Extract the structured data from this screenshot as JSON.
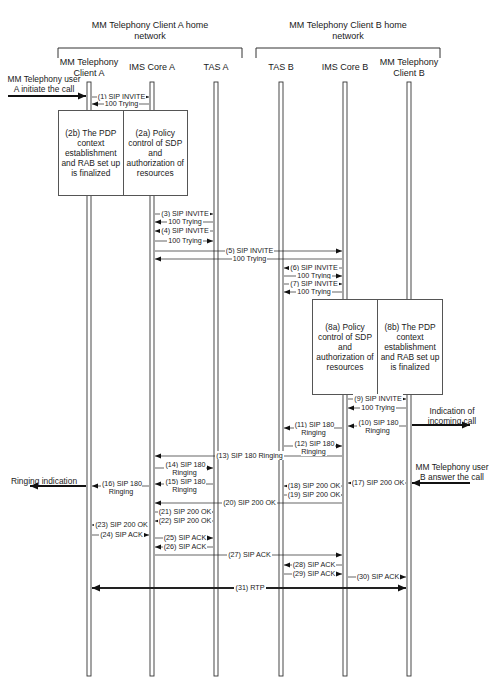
{
  "networks": [
    {
      "label_line1": "MM Telephony Client A home",
      "label_line2": "network",
      "bracket": [
        58,
        242
      ]
    },
    {
      "label_line1": "MM Telephony Client B home",
      "label_line2": "network",
      "bracket": [
        256,
        440
      ]
    }
  ],
  "lifelines": [
    {
      "id": "clientA",
      "line1": "MM Telephony",
      "line2": "Client  A",
      "x": 89
    },
    {
      "id": "imsA",
      "line1": "IMS Core A",
      "line2": "",
      "x": 152
    },
    {
      "id": "tasA",
      "line1": "TAS A",
      "line2": "",
      "x": 216
    },
    {
      "id": "tasB",
      "line1": "TAS B",
      "line2": "",
      "x": 281
    },
    {
      "id": "imsB",
      "line1": "IMS Core B",
      "line2": "",
      "x": 345
    },
    {
      "id": "clientB",
      "line1": "MM Telephony",
      "line2": "Client B",
      "x": 409
    }
  ],
  "lifeline_y": [
    82,
    676
  ],
  "boxes": [
    {
      "id": "box-2",
      "x": 58,
      "y": 110,
      "w": 128,
      "h": 84,
      "cells": [
        "(2b) The PDP context establishment and RAB set up is finalized",
        "(2a) Policy control of SDP and authorization of resources"
      ]
    },
    {
      "id": "box-8",
      "x": 312,
      "y": 299,
      "w": 129,
      "h": 94,
      "cells": [
        "(8a) Policy control of SDP and authorization of resources",
        "(8b) The PDP context establishment and RAB set up is finalized"
      ]
    }
  ],
  "messages": [
    {
      "n": 1,
      "from": "clientA",
      "to": "imsA",
      "y": 97,
      "text": "(1) SIP INVITE"
    },
    {
      "n": "1r",
      "from": "imsA",
      "to": "clientA",
      "y": 104,
      "text": "100 Trying"
    },
    {
      "n": 3,
      "from": "imsA",
      "to": "tasA",
      "y": 214,
      "text": "(3) SIP INVITE"
    },
    {
      "n": "3r",
      "from": "tasA",
      "to": "imsA",
      "y": 222,
      "text": "100 Trying"
    },
    {
      "n": 4,
      "from": "tasA",
      "to": "imsA",
      "y": 231,
      "text": "(4) SIP INVITE"
    },
    {
      "n": "4r",
      "from": "imsA",
      "to": "tasA",
      "y": 241,
      "text": "100 Trying"
    },
    {
      "n": 5,
      "from": "imsA",
      "to": "imsB",
      "y": 251,
      "text": "(5) SIP INVITE"
    },
    {
      "n": "5r",
      "from": "imsB",
      "to": "imsA",
      "y": 259,
      "text": "100 Trying"
    },
    {
      "n": 6,
      "from": "imsB",
      "to": "tasB",
      "y": 268,
      "text": "(6) SIP INVITE"
    },
    {
      "n": "6r",
      "from": "tasB",
      "to": "imsB",
      "y": 276,
      "text": "100 Trying"
    },
    {
      "n": 7,
      "from": "tasB",
      "to": "imsB",
      "y": 284,
      "text": "(7) SIP INVITE"
    },
    {
      "n": "7r",
      "from": "imsB",
      "to": "tasB",
      "y": 292,
      "text": "100 Trying"
    },
    {
      "n": 9,
      "from": "imsB",
      "to": "clientB",
      "y": 399,
      "text": "(9) SIP INVITE"
    },
    {
      "n": "9r",
      "from": "clientB",
      "to": "imsB",
      "y": 408,
      "text": "100 Trying"
    },
    {
      "n": 10,
      "from": "clientB",
      "to": "imsB",
      "y": 426,
      "text": "(10) SIP 180|Ringing",
      "labelY": 419
    },
    {
      "n": 11,
      "from": "imsB",
      "to": "tasB",
      "y": 428,
      "text": "(11) SIP 180|Ringing",
      "labelY": 421
    },
    {
      "n": 12,
      "from": "tasB",
      "to": "imsB",
      "y": 446,
      "text": "(12) SIP 180|Ringing",
      "labelY": 440
    },
    {
      "n": 13,
      "from": "imsB",
      "to": "imsA",
      "y": 456,
      "text": "(13) SIP 180 Ringing"
    },
    {
      "n": 14,
      "from": "imsA",
      "to": "tasA",
      "y": 468,
      "text": "(14) SIP 180|Ringing",
      "labelY": 461
    },
    {
      "n": 15,
      "from": "tasA",
      "to": "imsA",
      "y": 484,
      "text": "(15) SIP 180|Ringing",
      "labelY": 478
    },
    {
      "n": 16,
      "from": "imsA",
      "to": "clientA",
      "y": 486,
      "text": "(16) SIP 180|Ringing",
      "labelY": 480
    },
    {
      "n": 17,
      "from": "clientB",
      "to": "imsB",
      "y": 483,
      "text": "(17) SIP 200 OK"
    },
    {
      "n": 18,
      "from": "imsB",
      "to": "tasB",
      "y": 486,
      "text": "(18) SIP 200 OK"
    },
    {
      "n": 19,
      "from": "tasB",
      "to": "imsB",
      "y": 495,
      "text": "(19) SIP 200 OK"
    },
    {
      "n": 20,
      "from": "imsB",
      "to": "imsA",
      "y": 503,
      "text": "(20) SIP 200 OK"
    },
    {
      "n": 21,
      "from": "imsA",
      "to": "tasA",
      "y": 512,
      "text": "(21) SIP 200 OK"
    },
    {
      "n": 22,
      "from": "tasA",
      "to": "imsA",
      "y": 521,
      "text": "(22) SIP 200 OK"
    },
    {
      "n": 23,
      "from": "imsA",
      "to": "clientA",
      "y": 525,
      "text": "(23) SIP 200 OK"
    },
    {
      "n": 24,
      "from": "clientA",
      "to": "imsA",
      "y": 535,
      "text": "(24) SIP ACK"
    },
    {
      "n": 25,
      "from": "imsA",
      "to": "tasA",
      "y": 538,
      "text": "(25) SIP ACK"
    },
    {
      "n": 26,
      "from": "tasA",
      "to": "imsA",
      "y": 547,
      "text": "(26) SIP ACK"
    },
    {
      "n": 27,
      "from": "imsA",
      "to": "imsB",
      "y": 555,
      "text": "(27) SIP ACK"
    },
    {
      "n": 28,
      "from": "imsB",
      "to": "tasB",
      "y": 565,
      "text": "(28) SIP ACK"
    },
    {
      "n": 29,
      "from": "tasB",
      "to": "imsB",
      "y": 574,
      "text": "(29) SIP ACK"
    },
    {
      "n": 30,
      "from": "imsB",
      "to": "clientB",
      "y": 577,
      "text": "(30) SIP ACK"
    },
    {
      "n": 31,
      "from": "clientA",
      "to": "clientB",
      "y": 588,
      "text": "(31) RTP",
      "bidirectional": true,
      "bold": true
    }
  ],
  "external": [
    {
      "id": "userA-init",
      "text": "MM Telephony user|A initiate the call",
      "textX": 44,
      "textY": 74,
      "arrow": {
        "x1": 8,
        "x2": 86,
        "y": 96
      }
    },
    {
      "id": "incoming-indication",
      "text": "Indication of|incoming call",
      "textX": 452,
      "textY": 406,
      "arrow": {
        "x1": 412,
        "x2": 470,
        "y": 425
      }
    },
    {
      "id": "ringing-indication",
      "text": "Ringing indication",
      "textX": 44,
      "textY": 476,
      "arrow": {
        "x1": 86,
        "x2": 30,
        "y": 486
      }
    },
    {
      "id": "userB-answer",
      "text": "MM Telephony user|B answer the call",
      "textX": 452,
      "textY": 462,
      "arrow": {
        "x1": 470,
        "x2": 412,
        "y": 483
      }
    }
  ]
}
